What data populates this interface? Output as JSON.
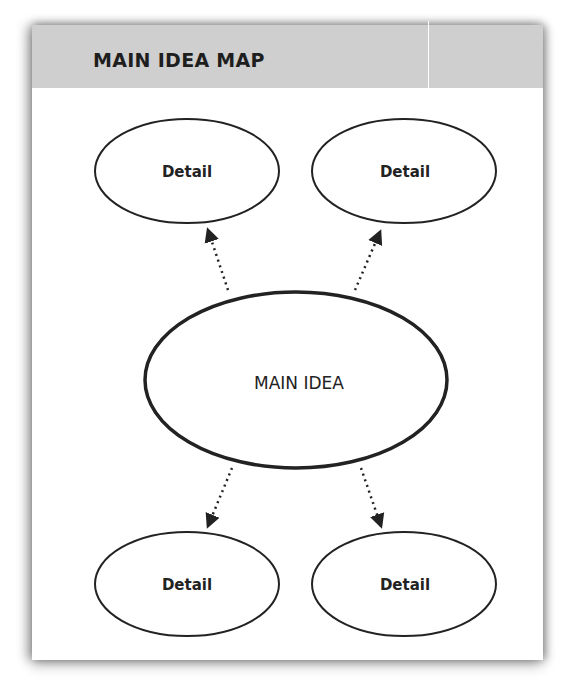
{
  "title": "MAIN IDEA MAP",
  "main_node": {
    "label": "MAIN IDEA"
  },
  "detail_nodes": [
    {
      "label": "Detail",
      "position": "top-left"
    },
    {
      "label": "Detail",
      "position": "top-right"
    },
    {
      "label": "Detail",
      "position": "bottom-left"
    },
    {
      "label": "Detail",
      "position": "bottom-right"
    }
  ],
  "connectors": [
    {
      "from": "MAIN IDEA",
      "to": "top-left",
      "style": "dotted-arrow"
    },
    {
      "from": "MAIN IDEA",
      "to": "top-right",
      "style": "dotted-arrow"
    },
    {
      "from": "MAIN IDEA",
      "to": "bottom-left",
      "style": "dotted-arrow"
    },
    {
      "from": "MAIN IDEA",
      "to": "bottom-right",
      "style": "dotted-arrow"
    }
  ],
  "colors": {
    "header_bg": "#cfcfcf",
    "stroke": "#222222",
    "card_bg": "#ffffff"
  }
}
